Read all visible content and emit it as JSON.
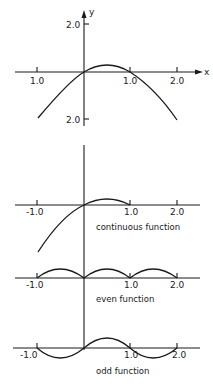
{
  "top_plot": {
    "y_axis_label": "y",
    "x_axis_label": "x",
    "y_tick_top": "2.0",
    "y_tick_bottom": "2.0",
    "x_ticks": [
      "1.0",
      "1.0",
      "2.0"
    ]
  },
  "continuous_plot": {
    "caption": "continuous function",
    "x_ticks": [
      "-1.0",
      "1.0",
      "2.0"
    ]
  },
  "even_plot": {
    "caption": "even function",
    "x_ticks": [
      "-1.0",
      "1.0",
      "2.0"
    ]
  },
  "odd_plot": {
    "caption": "odd function",
    "x_ticks": [
      "-1.0",
      "1.0",
      "2.0"
    ]
  }
}
